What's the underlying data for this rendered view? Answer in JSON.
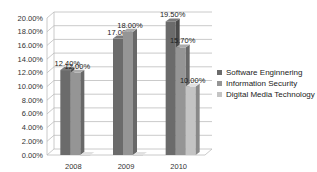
{
  "chart_data": {
    "type": "bar",
    "title": "",
    "xlabel": "",
    "ylabel": "",
    "categories": [
      "2008",
      "2009",
      "2010"
    ],
    "series": [
      {
        "name": "Software Enginnering",
        "values": [
          12.4,
          17.0,
          19.5
        ],
        "labels": [
          "12.40%",
          "17.00%",
          "19.50%"
        ],
        "color": "#6b6b6b"
      },
      {
        "name": "Information Security",
        "values": [
          12.0,
          18.0,
          15.7
        ],
        "labels": [
          "12.00%",
          "18.00%",
          "15.70%"
        ],
        "color": "#959595"
      },
      {
        "name": "Digital Media Technology",
        "values": [
          0,
          0,
          10.0
        ],
        "labels": [
          "",
          "",
          "10.00%"
        ],
        "color": "#c4c4c4"
      }
    ],
    "ylim": [
      0,
      20
    ],
    "yticks": [
      "0.00%",
      "2.00%",
      "4.00%",
      "6.00%",
      "8.00%",
      "10.00%",
      "12.00%",
      "14.00%",
      "16.00%",
      "18.00%",
      "20.00%"
    ],
    "grid": true,
    "legend_position": "right",
    "style": "3d-clustered-column"
  }
}
